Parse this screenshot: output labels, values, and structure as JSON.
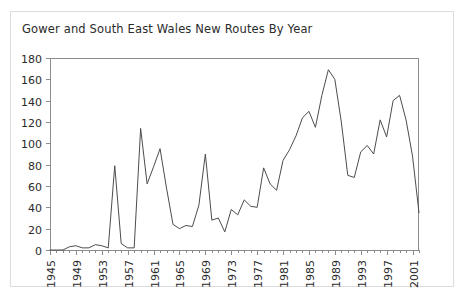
{
  "figure": {
    "title": "Gower and South East Wales New Routes By Year",
    "background": "#ffffff",
    "frame_color": "#dcdcdc"
  },
  "chart_data": {
    "type": "line",
    "title": "Gower and South East Wales New Routes By Year",
    "xlabel": "",
    "ylabel": "",
    "xlim": [
      1945,
      2002
    ],
    "ylim": [
      0,
      180
    ],
    "yticks": [
      0,
      20,
      40,
      60,
      80,
      100,
      120,
      140,
      160,
      180
    ],
    "xticks": [
      1945,
      1949,
      1953,
      1957,
      1961,
      1965,
      1969,
      1973,
      1977,
      1981,
      1985,
      1989,
      1993,
      1997,
      2001
    ],
    "xtick_labels": [
      "1945",
      "1949",
      "1953",
      "1957",
      "1961",
      "1965",
      "1969",
      "1973",
      "1977",
      "1981",
      "1985",
      "1989",
      "1993",
      "1997",
      "2001"
    ],
    "xtick_rotation": 90,
    "grid": false,
    "legend": false,
    "line_color": "#4c4c4c",
    "series": [
      {
        "name": "New Routes",
        "x": [
          1945,
          1946,
          1947,
          1948,
          1949,
          1950,
          1951,
          1952,
          1953,
          1954,
          1955,
          1956,
          1957,
          1958,
          1959,
          1960,
          1961,
          1962,
          1963,
          1964,
          1965,
          1966,
          1967,
          1968,
          1969,
          1970,
          1971,
          1972,
          1973,
          1974,
          1975,
          1976,
          1977,
          1978,
          1979,
          1980,
          1981,
          1982,
          1983,
          1984,
          1985,
          1986,
          1987,
          1988,
          1989,
          1990,
          1991,
          1992,
          1993,
          1994,
          1995,
          1996,
          1997,
          1998,
          1999,
          2000,
          2001,
          2002
        ],
        "values": [
          0,
          0,
          0,
          3,
          4,
          2,
          2,
          5,
          4,
          2,
          79,
          6,
          2,
          2,
          114,
          62,
          78,
          95,
          58,
          24,
          20,
          23,
          22,
          42,
          90,
          28,
          30,
          17,
          38,
          33,
          47,
          41,
          40,
          77,
          62,
          56,
          84,
          94,
          107,
          124,
          130,
          115,
          145,
          169,
          160,
          120,
          70,
          68,
          92,
          98,
          90,
          122,
          106,
          140,
          145,
          122,
          88,
          35
        ]
      }
    ]
  },
  "axes": {
    "plot_left_px": 50,
    "plot_right_px": 419,
    "plot_top_px": 58,
    "plot_bottom_px": 250
  }
}
